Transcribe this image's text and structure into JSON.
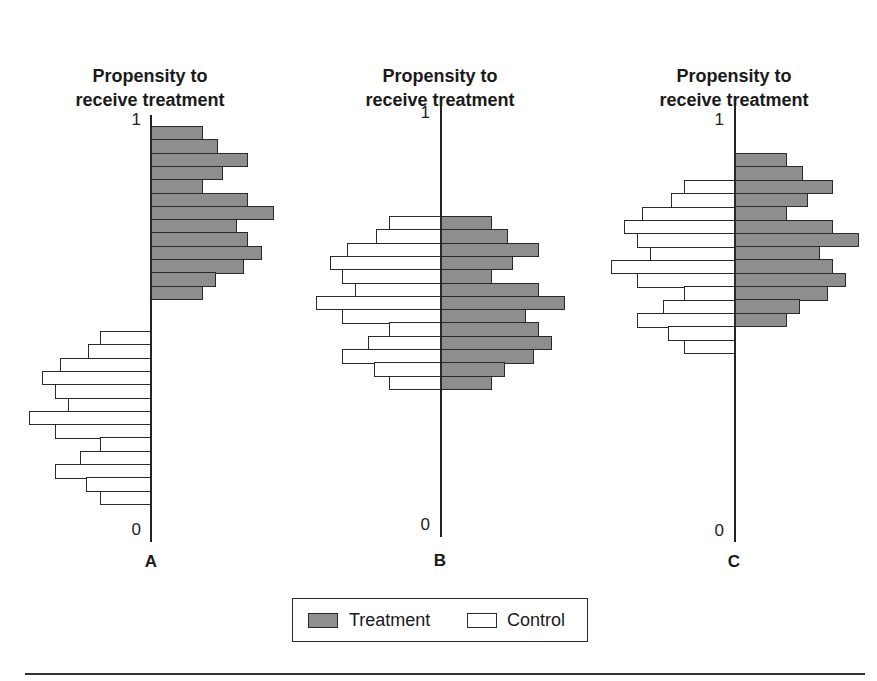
{
  "chart_data": [
    {
      "type": "bar",
      "orientation": "horizontal back-to-back histogram",
      "panel": "A",
      "title": "Propensity to receive treatment",
      "ylabel": "Propensity to receive treatment",
      "ylim": [
        0,
        1
      ],
      "y_tick_labels": [
        "0",
        "1"
      ],
      "series": [
        {
          "name": "Treatment",
          "side": "right",
          "position": "upper (high propensity)",
          "values": [
            52,
            67,
            97,
            72,
            52,
            97,
            123,
            86,
            97,
            111,
            93,
            65,
            52
          ]
        },
        {
          "name": "Control",
          "side": "left",
          "position": "lower (low propensity)",
          "values": [
            51,
            63,
            91,
            109,
            96,
            83,
            122,
            96,
            51,
            71,
            96,
            65,
            51
          ]
        }
      ],
      "note": "No overlap between treatment and control propensity distributions"
    },
    {
      "type": "bar",
      "orientation": "horizontal back-to-back histogram",
      "panel": "B",
      "title": "Propensity to receive treatment",
      "ylabel": "Propensity to receive treatment",
      "ylim": [
        0,
        1
      ],
      "y_tick_labels": [
        "0",
        "1"
      ],
      "series": [
        {
          "name": "Treatment",
          "side": "right",
          "values": [
            51,
            67,
            98,
            72,
            51,
            98,
            124,
            85,
            98,
            111,
            93,
            64,
            51
          ]
        },
        {
          "name": "Control",
          "side": "left",
          "values": [
            52,
            65,
            94,
            111,
            99,
            86,
            125,
            99,
            52,
            73,
            99,
            67,
            52
          ]
        }
      ],
      "note": "Complete overlap between treatment and control"
    },
    {
      "type": "bar",
      "orientation": "horizontal back-to-back histogram",
      "panel": "C",
      "title": "Propensity to receive treatment",
      "ylabel": "Propensity to receive treatment",
      "ylim": [
        0,
        1
      ],
      "y_tick_labels": [
        "0",
        "1"
      ],
      "series": [
        {
          "name": "Treatment",
          "side": "right",
          "values": [
            52,
            68,
            98,
            73,
            52,
            98,
            124,
            85,
            98,
            111,
            93,
            65,
            52
          ]
        },
        {
          "name": "Control",
          "side": "left",
          "values": [
            51,
            64,
            93,
            111,
            98,
            85,
            124,
            98,
            51,
            72,
            98,
            67,
            51
          ]
        }
      ],
      "note": "Partial overlap; treatment shifted upward"
    }
  ],
  "panels": [
    {
      "title_line1": "Propensity to",
      "title_line2": "receive treatment",
      "top_tick": "1",
      "bottom_tick": "0",
      "letter": "A"
    },
    {
      "title_line1": "Propensity to",
      "title_line2": "receive treatment",
      "top_tick": "1",
      "bottom_tick": "0",
      "letter": "B"
    },
    {
      "title_line1": "Propensity to",
      "title_line2": "receive treatment",
      "top_tick": "1",
      "bottom_tick": "0",
      "letter": "C"
    }
  ],
  "legend": {
    "treatment_label": "Treatment",
    "control_label": "Control"
  },
  "colors": {
    "treatment_fill": "#9c9c9c",
    "control_fill": "#ffffff",
    "stroke": "#2a2a2a"
  }
}
